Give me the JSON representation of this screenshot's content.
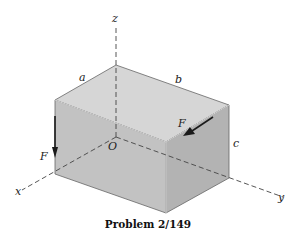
{
  "figure": {
    "caption": "Problem 2/149",
    "labels": {
      "x_axis": "x",
      "y_axis": "y",
      "z_axis": "z",
      "origin": "O",
      "edge_a": "a",
      "edge_b": "b",
      "edge_c": "c",
      "force_left": "F",
      "force_top": "F"
    },
    "colors": {
      "top_face": "#d6d6d6",
      "left_face": "#c2c2c2",
      "right_face": "#b3b3b3",
      "edge": "#555555",
      "axis": "#444444",
      "arrow": "#1a1a1a"
    }
  }
}
